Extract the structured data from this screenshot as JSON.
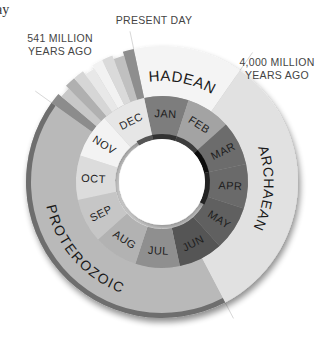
{
  "chart_data": {
    "type": "pie",
    "subtype": "double-ring donut (earth history mapped to one calendar year)",
    "title": "",
    "corner_fragment": "ay",
    "geometry": {
      "cx": 162,
      "cy": 182,
      "hole_r": 43,
      "month_inner_r": 47,
      "month_outer_r": 86,
      "eon_outer_r": 136,
      "start_angle_deg": -12
    },
    "inner_arc": {
      "description": "thin dark arc hugging the hole from DEC to MAY",
      "r_inner": 43,
      "r_outer": 48
    },
    "months": [
      {
        "label": "JAN",
        "color": "#7d7d7d"
      },
      {
        "label": "FEB",
        "color": "#a3a3a3"
      },
      {
        "label": "MAR",
        "color": "#6c6c6c"
      },
      {
        "label": "APR",
        "color": "#6a6a6a"
      },
      {
        "label": "MAY",
        "color": "#616161"
      },
      {
        "label": "JUN",
        "color": "#545454"
      },
      {
        "label": "JUL",
        "color": "#8f8f8f"
      },
      {
        "label": "AUG",
        "color": "#b2b2b2"
      },
      {
        "label": "SEP",
        "color": "#c6c6c6"
      },
      {
        "label": "OCT",
        "color": "#dcdcdc"
      },
      {
        "label": "NOV",
        "color": "#f3f3f3"
      },
      {
        "label": "DEC",
        "color": "#e6e6e6"
      }
    ],
    "eons": [
      {
        "label": "HADEAN",
        "start_mya": 4600,
        "end_mya": 4000,
        "color": "#f4f4f4"
      },
      {
        "label": "ARCHAEAN",
        "start_mya": 4000,
        "end_mya": 2500,
        "color": "#e1e1e1"
      },
      {
        "label": "PROTEROZOIC",
        "start_mya": 2500,
        "end_mya": 541,
        "color": "#b9b9b9"
      },
      {
        "label": "",
        "start_mya": 541,
        "end_mya": 0,
        "color": "#cfcfcf",
        "note": "Phanerozoic, subdivided into narrow period bands"
      }
    ],
    "phanerozoic_bands": [
      "#8c8c8c",
      "#c8c8c8",
      "#b0b0b0",
      "#d6d6d6",
      "#e8e8e8",
      "#f2f2f2",
      "#dadada",
      "#c0c0c0",
      "#8e8e8e"
    ],
    "annotations": [
      {
        "text": "PRESENT DAY",
        "lines": [
          "PRESENT DAY"
        ],
        "mya": 0
      },
      {
        "text": "541 MILLION YEARS AGO",
        "lines": [
          "541 MILLION",
          "YEARS AGO"
        ],
        "mya": 541
      },
      {
        "text": "4,000 MILLION YEARS AGO",
        "lines": [
          "4,000 MILLION",
          "YEARS AGO"
        ],
        "mya": 4000
      },
      {
        "text": "",
        "lines": [],
        "mya": 2500,
        "note": "leader line only, label cropped"
      }
    ],
    "total_mya": 4600
  }
}
